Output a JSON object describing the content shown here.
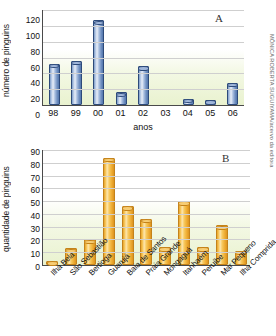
{
  "credit": "MÔNICA ROBERTA SUGUIYAMA/acervo da editora",
  "panelA": {
    "letter": "A",
    "ylabel": "número de pinguins",
    "xlabel": "anos"
  },
  "panelB": {
    "letter": "B",
    "ylabel": "quantidade de pinguins",
    "xlabel": ""
  },
  "chart_data": [
    {
      "type": "bar",
      "title": "A",
      "xlabel": "anos",
      "ylabel": "número de pinguins",
      "ylim": [
        0,
        120
      ],
      "yticks": [
        0,
        20,
        40,
        60,
        80,
        100,
        120
      ],
      "grid": true,
      "legend": "none",
      "categories": [
        "98",
        "99",
        "00",
        "01",
        "02",
        "03",
        "04",
        "05",
        "06"
      ],
      "values": [
        52,
        56,
        107,
        16,
        49,
        0,
        8,
        6,
        28
      ],
      "color": "#5377ad"
    },
    {
      "type": "bar",
      "title": "B",
      "xlabel": "",
      "ylabel": "quantidade de pinguins",
      "ylim": [
        0,
        90
      ],
      "yticks": [
        0,
        10,
        20,
        30,
        40,
        50,
        60,
        70,
        80,
        90
      ],
      "grid": true,
      "legend": "none",
      "categories": [
        "Ilha Bela",
        "São Sebastião",
        "Bertioga",
        "Guarujá",
        "Baía de Santos",
        "Praia Grande",
        "Mongaguá",
        "Itanhaém",
        "Peruíbe",
        "Mar Pequeno",
        "Ilha Comprida"
      ],
      "values": [
        3,
        13,
        20,
        84,
        46,
        36,
        14,
        50,
        14,
        31,
        11
      ],
      "color": "#eeac33"
    }
  ]
}
